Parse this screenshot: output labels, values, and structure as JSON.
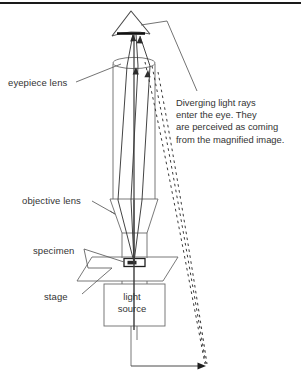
{
  "figure": {
    "kind": "optical-ray-diagram",
    "background_color": "#ffffff",
    "line_color": "#555555",
    "text_color": "#333333",
    "ray_color": "#3a3a3a",
    "top_rule_color": "#1a1a1a"
  },
  "labels": {
    "eyepiece_lens": "eyepiece lens",
    "objective_lens": "objective lens",
    "specimen": "specimen",
    "stage": "stage"
  },
  "light_source": {
    "line1": "light",
    "line2": "source"
  },
  "note": {
    "line1": "Diverging light rays",
    "line2": "enter the eye. They",
    "line3": "are perceived as coming",
    "line4": "from the magnified image."
  },
  "parts": {
    "eye": "eye-symbol",
    "tube": "microscope-body-tube",
    "eyepiece": "eyepiece-lens-ellipse",
    "objective": "objective-lens-trapezoid",
    "stage_platform": "stage-parallelogram",
    "specimen_slide": "specimen-slide",
    "lamp_housing": "light-source-box",
    "solid_rays": "converging-light-rays",
    "dashed_rays": "virtual-image-projection-rays",
    "image_arrow": "magnified-virtual-image-arrow"
  }
}
